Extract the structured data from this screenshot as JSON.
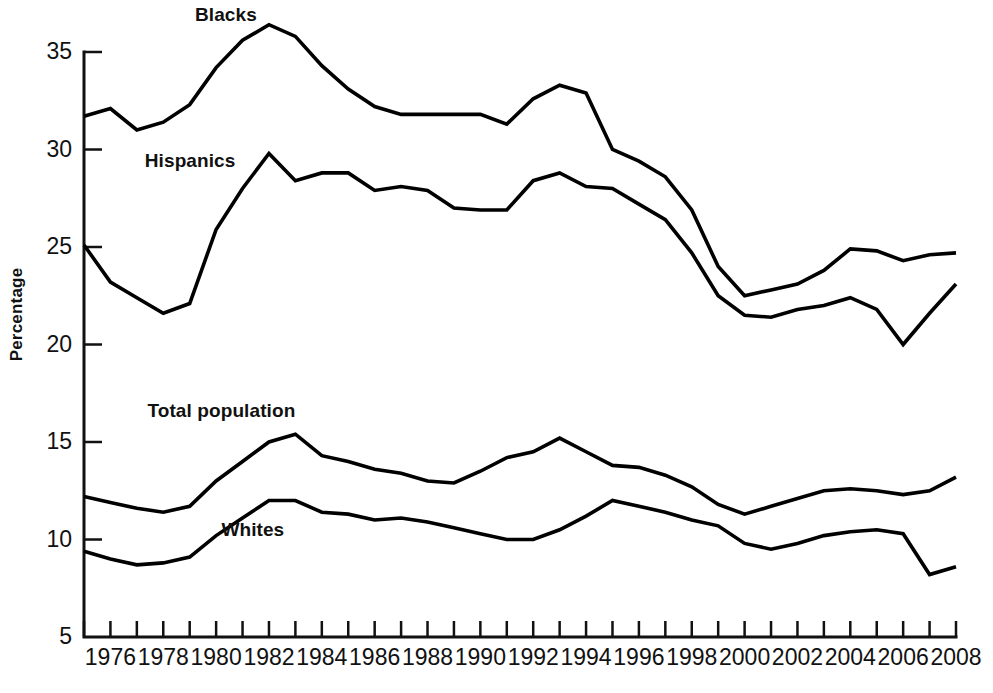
{
  "chart_data": {
    "type": "line",
    "title": "",
    "xlabel": "",
    "ylabel": "Percentage",
    "xlim": [
      1975,
      2008
    ],
    "ylim": [
      5,
      35
    ],
    "grid": false,
    "legend_position": "inline-labels",
    "x": [
      1975,
      1976,
      1977,
      1978,
      1979,
      1980,
      1981,
      1982,
      1983,
      1984,
      1985,
      1986,
      1987,
      1988,
      1989,
      1990,
      1991,
      1992,
      1993,
      1994,
      1995,
      1996,
      1997,
      1998,
      1999,
      2000,
      2001,
      2002,
      2003,
      2004,
      2005,
      2006,
      2007,
      2008
    ],
    "ytick_labels": [
      "5",
      "10",
      "15",
      "20",
      "25",
      "30",
      "35"
    ],
    "ytick_values": [
      5,
      10,
      15,
      20,
      25,
      30,
      35
    ],
    "xtick_labels": [
      "1976",
      "1978",
      "1980",
      "1982",
      "1984",
      "1986",
      "1988",
      "1990",
      "1992",
      "1994",
      "1996",
      "1998",
      "2000",
      "2002",
      "2004",
      "2006",
      "2008"
    ],
    "xtick_values": [
      1976,
      1978,
      1980,
      1982,
      1984,
      1986,
      1988,
      1990,
      1992,
      1994,
      1996,
      1998,
      2000,
      2002,
      2004,
      2006,
      2008
    ],
    "xminor_values": [
      1975,
      1977,
      1979,
      1981,
      1983,
      1985,
      1987,
      1989,
      1991,
      1993,
      1995,
      1997,
      1999,
      2001,
      2003,
      2005,
      2007
    ],
    "series": [
      {
        "name": "Blacks",
        "label": "Blacks",
        "label_x": 1979.2,
        "label_y": 36.6,
        "values": [
          31.7,
          32.1,
          31.0,
          31.4,
          32.3,
          34.2,
          35.6,
          36.4,
          35.8,
          34.3,
          33.1,
          32.2,
          31.8,
          31.8,
          31.8,
          31.8,
          31.3,
          32.6,
          33.3,
          32.9,
          30.0,
          29.4,
          28.6,
          26.9,
          24.0,
          22.5,
          22.8,
          23.1,
          23.8,
          24.9,
          24.8,
          24.3,
          24.6,
          24.7
        ]
      },
      {
        "name": "Hispanics",
        "label": "Hispanics",
        "label_x": 1977.3,
        "label_y": 29.1,
        "values": [
          25.1,
          23.2,
          22.4,
          21.6,
          22.1,
          25.9,
          28.0,
          29.8,
          28.4,
          28.8,
          28.8,
          27.9,
          28.1,
          27.9,
          27.0,
          26.9,
          26.9,
          28.4,
          28.8,
          28.1,
          28.0,
          27.2,
          26.4,
          24.7,
          22.5,
          21.5,
          21.4,
          21.8,
          22.0,
          22.4,
          21.8,
          20.0,
          21.6,
          23.1
        ]
      },
      {
        "name": "Total population",
        "label": "Total population",
        "label_x": 1977.4,
        "label_y": 16.3,
        "values": [
          12.2,
          11.9,
          11.6,
          11.4,
          11.7,
          13.0,
          14.0,
          15.0,
          15.4,
          14.3,
          14.0,
          13.6,
          13.4,
          13.0,
          12.9,
          13.5,
          14.2,
          14.5,
          15.2,
          14.5,
          13.8,
          13.7,
          13.3,
          12.7,
          11.8,
          11.3,
          11.7,
          12.1,
          12.5,
          12.6,
          12.5,
          12.3,
          12.5,
          13.2
        ]
      },
      {
        "name": "Whites",
        "label": "Whites",
        "label_x": 1980.2,
        "label_y": 10.2,
        "values": [
          9.4,
          9.0,
          8.7,
          8.8,
          9.1,
          10.2,
          11.1,
          12.0,
          12.0,
          11.4,
          11.3,
          11.0,
          11.1,
          10.9,
          10.6,
          10.3,
          10.0,
          10.0,
          10.5,
          11.2,
          12.0,
          11.7,
          11.4,
          11.0,
          10.7,
          9.8,
          9.5,
          9.8,
          10.2,
          10.4,
          10.5,
          10.3,
          8.2,
          8.6
        ]
      }
    ]
  }
}
